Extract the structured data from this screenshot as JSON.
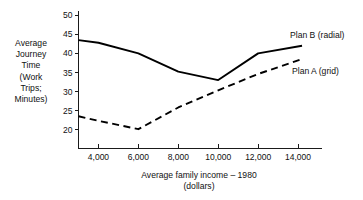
{
  "chart_data": {
    "type": "line",
    "title": "",
    "xlabel": "Average family income – 1980\n(dollars)",
    "ylabel": "Average\nJourney\nTime\n(Work\nTrips;\nMinutes)",
    "x": [
      3000,
      4000,
      6000,
      8000,
      10000,
      12000,
      14000
    ],
    "xlim": [
      3000,
      15200
    ],
    "ylim": [
      17,
      51
    ],
    "xticks": [
      4000,
      6000,
      8000,
      10000,
      12000,
      14000
    ],
    "xtick_labels": [
      "4,000",
      "6,000",
      "8,000",
      "10,000",
      "12,000",
      "14,000"
    ],
    "yticks": [
      20,
      25,
      30,
      35,
      40,
      45,
      50
    ],
    "ytick_labels": [
      "20",
      "25",
      "30",
      "35",
      "40",
      "45",
      "50"
    ],
    "grid": false,
    "legend_position": "inline-right",
    "series": [
      {
        "name": "Plan B (radial)",
        "style": "solid",
        "color": "#000000",
        "x": [
          3000,
          4000,
          6000,
          8000,
          10000,
          12000,
          14200
        ],
        "values": [
          43.5,
          42.8,
          40.0,
          35.2,
          33.0,
          40.0,
          42.0
        ]
      },
      {
        "name": "Plan A (grid)",
        "style": "dashed",
        "color": "#000000",
        "x": [
          3000,
          4000,
          6000,
          8000,
          10000,
          12000,
          14200
        ],
        "values": [
          23.5,
          22.3,
          20.1,
          25.8,
          30.3,
          34.6,
          38.5
        ]
      }
    ],
    "legend": [
      {
        "label": "Plan B (radial)"
      },
      {
        "label": "Plan A (grid)"
      }
    ]
  },
  "axes": {
    "y_title": "Average\nJourney\nTime\n(Work\nTrips;\nMinutes)",
    "x_title": "Average family income – 1980\n(dollars)"
  },
  "legend": {
    "plan_b": "Plan B (radial)",
    "plan_a": "Plan A (grid)"
  },
  "colors": {
    "background": "#ffffff",
    "ink": "#111111",
    "series": "#000000"
  }
}
